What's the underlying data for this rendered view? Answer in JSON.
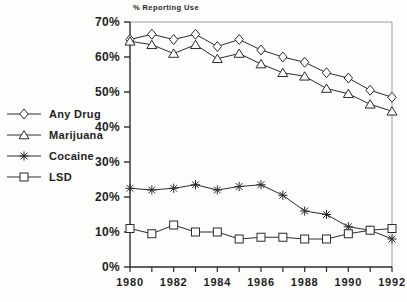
{
  "chart_data": {
    "type": "line",
    "title": "% Reporting Use",
    "xlabel": "",
    "ylabel": "% Reporting Use",
    "x": [
      1980,
      1981,
      1982,
      1983,
      1984,
      1985,
      1986,
      1987,
      1988,
      1989,
      1990,
      1991,
      1992
    ],
    "x_labeled_ticks": [
      {
        "value": 1980,
        "label": "1980"
      },
      {
        "value": 1982,
        "label": "1982"
      },
      {
        "value": 1984,
        "label": "1984"
      },
      {
        "value": 1986,
        "label": "1986"
      },
      {
        "value": 1988,
        "label": "1988"
      },
      {
        "value": 1990,
        "label": "1990"
      },
      {
        "value": 1992,
        "label": "1992"
      }
    ],
    "y_ticks": [
      {
        "value": 0,
        "label": "0%"
      },
      {
        "value": 10,
        "label": "10%"
      },
      {
        "value": 20,
        "label": "20%"
      },
      {
        "value": 30,
        "label": "30%"
      },
      {
        "value": 40,
        "label": "40%"
      },
      {
        "value": 50,
        "label": "50%"
      },
      {
        "value": 60,
        "label": "60%"
      },
      {
        "value": 70,
        "label": "70%"
      }
    ],
    "ylim": [
      0,
      70
    ],
    "xlim": [
      1980,
      1992
    ],
    "grid": false,
    "legend_position": "left",
    "series": [
      {
        "name": "Any Drug",
        "marker": "diamond",
        "values": [
          65,
          66.5,
          65,
          66.5,
          63,
          65,
          62,
          60,
          58.5,
          55.5,
          54,
          50.5,
          48.5
        ]
      },
      {
        "name": "Marijuana",
        "marker": "triangle",
        "values": [
          64.5,
          63.5,
          61,
          63.5,
          59.5,
          61,
          58,
          55.5,
          54.5,
          51,
          49.5,
          46.5,
          44.5
        ]
      },
      {
        "name": "Cocaine",
        "marker": "asterisk",
        "values": [
          22.5,
          22,
          22.5,
          23.5,
          22,
          23,
          23.5,
          20.5,
          16,
          15,
          11.5,
          10.5,
          8
        ]
      },
      {
        "name": "LSD",
        "marker": "square",
        "values": [
          11,
          9.5,
          12,
          10,
          10,
          8,
          8.5,
          8.5,
          8,
          8,
          9.5,
          10.5,
          11
        ]
      }
    ],
    "colors": {
      "line": "#2b2b2b",
      "axis": "#2b2b2b",
      "frame_light": "#9d9d9d",
      "background": "#fdfdfc",
      "text": "#1f1f1f"
    }
  }
}
